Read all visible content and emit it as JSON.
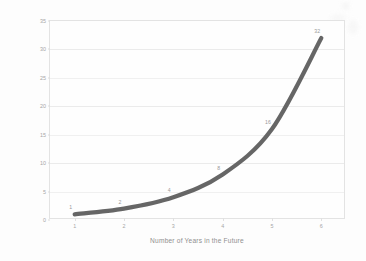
{
  "chart_data": {
    "type": "line",
    "title": "",
    "subtitle": "",
    "xlabel": "Number of Years in the Future",
    "ylabel": "Increase in our Current Technological Ability",
    "x": [
      1,
      2,
      3,
      4,
      5,
      6
    ],
    "values": [
      1,
      2,
      4,
      8,
      16,
      32
    ],
    "point_labels": [
      "1",
      "2",
      "4",
      "8",
      "16",
      "32"
    ],
    "series": [
      {
        "name": "Increase in our Current Technological Ability",
        "values": [
          1,
          2,
          4,
          8,
          16,
          32
        ],
        "color": "#595959"
      }
    ],
    "xtick_labels": [
      "1",
      "2",
      "3",
      "4",
      "5",
      "6"
    ],
    "ytick_labels": [
      "0",
      "5",
      "10",
      "15",
      "20",
      "25",
      "30",
      "35"
    ],
    "ytick_values": [
      0,
      5,
      10,
      15,
      20,
      25,
      30,
      35
    ],
    "xlim": [
      0.5,
      6.5
    ],
    "ylim": [
      0,
      35
    ],
    "grid": "horizontal",
    "legend": "none",
    "annotations": []
  },
  "style": {
    "line_color": "#595959",
    "grid_color": "#f0f0f0",
    "axis_color": "#e3e3e3",
    "tick_text_color": "#a6a6a6",
    "axis_title_color": "#8f8f8f",
    "plot_background": "#fefefe",
    "figure_background": "#fdfdfd"
  }
}
